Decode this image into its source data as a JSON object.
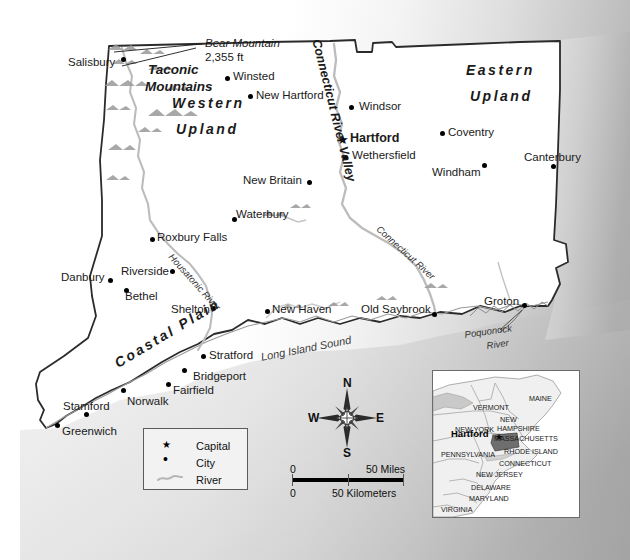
{
  "map": {
    "title": "Connecticut reference map",
    "state": "Connecticut",
    "capital_name": "Hartford",
    "cities": [
      {
        "name": "Salisbury",
        "label_x": 68,
        "label_y": 57,
        "dot_x": 123,
        "dot_y": 59
      },
      {
        "name": "Winsted",
        "label_x": 233,
        "label_y": 71,
        "dot_x": 227,
        "dot_y": 78
      },
      {
        "name": "New Hartford",
        "label_x": 256,
        "label_y": 90,
        "dot_x": 250,
        "dot_y": 96
      },
      {
        "name": "Windsor",
        "label_x": 359,
        "label_y": 101,
        "dot_x": 351,
        "dot_y": 107
      },
      {
        "name": "Coventry",
        "label_x": 448,
        "label_y": 127,
        "dot_x": 442,
        "dot_y": 133
      },
      {
        "name": "Canterbury",
        "label_x": 524,
        "label_y": 152,
        "dot_x": 553,
        "dot_y": 166
      },
      {
        "name": "Wethersfield",
        "label_x": 352,
        "label_y": 150,
        "dot_x": 345,
        "dot_y": 157
      },
      {
        "name": "Windham",
        "label_x": 432,
        "label_y": 167,
        "dot_x": 484,
        "dot_y": 165
      },
      {
        "name": "New Britain",
        "label_x": 243,
        "label_y": 175,
        "dot_x": 309,
        "dot_y": 182
      },
      {
        "name": "Waterbury",
        "label_x": 236,
        "label_y": 209,
        "dot_x": 234,
        "dot_y": 219
      },
      {
        "name": "Roxbury Falls",
        "label_x": 157,
        "label_y": 232,
        "dot_x": 152,
        "dot_y": 239
      },
      {
        "name": "Danbury",
        "label_x": 61,
        "label_y": 272,
        "dot_x": 110,
        "dot_y": 280
      },
      {
        "name": "Riverside",
        "label_x": 121,
        "label_y": 266,
        "dot_x": 172,
        "dot_y": 271
      },
      {
        "name": "Bethel",
        "label_x": 125,
        "label_y": 291,
        "dot_x": 126,
        "dot_y": 290
      },
      {
        "name": "Shelton",
        "label_x": 171,
        "label_y": 304,
        "dot_x": 213,
        "dot_y": 308
      },
      {
        "name": "New Haven",
        "label_x": 272,
        "label_y": 304,
        "dot_x": 267,
        "dot_y": 311
      },
      {
        "name": "Old Saybrook",
        "label_x": 361,
        "label_y": 304,
        "dot_x": 434,
        "dot_y": 314
      },
      {
        "name": "Groton",
        "label_x": 484,
        "label_y": 296,
        "dot_x": 524,
        "dot_y": 305
      },
      {
        "name": "Stratford",
        "label_x": 209,
        "label_y": 350,
        "dot_x": 203,
        "dot_y": 356
      },
      {
        "name": "Bridgeport",
        "label_x": 193,
        "label_y": 371,
        "dot_x": 184,
        "dot_y": 370
      },
      {
        "name": "Fairfield",
        "label_x": 173,
        "label_y": 385,
        "dot_x": 168,
        "dot_y": 384
      },
      {
        "name": "Norwalk",
        "label_x": 127,
        "label_y": 396,
        "dot_x": 123,
        "dot_y": 390
      },
      {
        "name": "Stamford",
        "label_x": 63,
        "label_y": 401,
        "dot_x": 86,
        "dot_y": 414
      },
      {
        "name": "Greenwich",
        "label_x": 62,
        "label_y": 426,
        "dot_x": 57,
        "dot_y": 425
      }
    ],
    "capital": {
      "name": "Hartford",
      "label_x": 350,
      "label_y": 132,
      "star_x": 337,
      "star_y": 134
    },
    "regions": [
      {
        "name": "Western\nUpland",
        "lines": [
          "Western",
          "Upland"
        ],
        "x": 172,
        "y": 98
      },
      {
        "name": "Eastern\nUpland",
        "lines": [
          "Eastern",
          "Upland"
        ],
        "x": 465,
        "y": 64
      },
      {
        "name": "Taconic Mountains",
        "lines": [
          "Taconic",
          "Mountains"
        ],
        "x": 145,
        "y": 63
      },
      {
        "name": "Coastal Plain",
        "x": 112,
        "y": 332
      }
    ],
    "peak": {
      "name": "Bear Mountain",
      "elevation": "2,355 ft",
      "x": 205,
      "y": 38
    },
    "valley": {
      "name": "Connecticut River Valley",
      "x": 328,
      "y": 38
    },
    "rivers": [
      {
        "name": "Housatonic River",
        "x": 175,
        "y": 252
      },
      {
        "name": "Connecticut River",
        "x": 383,
        "y": 226
      },
      {
        "name": "Poquonock River",
        "lines": [
          "Poquonock",
          "River"
        ],
        "x": 471,
        "y": 327
      }
    ],
    "water_bodies": [
      {
        "name": "Long Island Sound",
        "x": 261,
        "y": 344
      }
    ]
  },
  "legend": {
    "title": "Legend",
    "items": [
      {
        "symbol": "star",
        "label": "Capital"
      },
      {
        "symbol": "dot",
        "label": "City"
      },
      {
        "symbol": "river",
        "label": "River"
      }
    ]
  },
  "scale": {
    "miles_zero": "0",
    "miles_max": "50 Miles",
    "km_zero": "0",
    "km_max": "50 Kilometers"
  },
  "compass": {
    "north": "N",
    "south": "S",
    "east": "E",
    "west": "W"
  },
  "inset": {
    "capital_label": "Hartford",
    "states": [
      {
        "name": "MAINE",
        "x": 96,
        "y": 24
      },
      {
        "name": "VERMONT",
        "x": 40,
        "y": 33
      },
      {
        "name": "NEW",
        "x": 67,
        "y": 45
      },
      {
        "name": "HAMPSHIRE",
        "x": 64,
        "y": 54
      },
      {
        "name": "NEW YORK",
        "x": 22,
        "y": 55
      },
      {
        "name": "MASSACHUSETTS",
        "x": 61,
        "y": 64
      },
      {
        "name": "RHODE ISLAND",
        "x": 71,
        "y": 77
      },
      {
        "name": "PENNSYLVANIA",
        "x": 8,
        "y": 80
      },
      {
        "name": "CONNECTICUT",
        "x": 66,
        "y": 89
      },
      {
        "name": "NEW JERSEY",
        "x": 43,
        "y": 100
      },
      {
        "name": "DELAWARE",
        "x": 38,
        "y": 113
      },
      {
        "name": "MARYLAND",
        "x": 36,
        "y": 124
      },
      {
        "name": "VIRGINIA",
        "x": 8,
        "y": 135
      }
    ]
  },
  "colors": {
    "land": "#ffffff",
    "border": "#2b2b2b",
    "water": "#b8b8b8",
    "river": "#b5b5b5",
    "legend_bg": "#f2f2f2",
    "text": "#1a1a1a"
  }
}
